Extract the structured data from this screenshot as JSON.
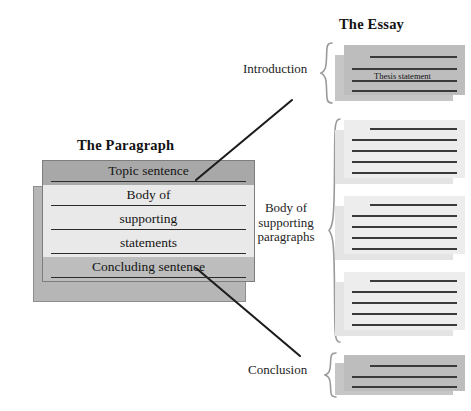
{
  "diagram": {
    "title_left": "The Paragraph",
    "title_right": "The Essay",
    "background_color": "#ffffff",
    "ink_color": "#1a1a1a"
  },
  "paragraph": {
    "heading": "The Paragraph",
    "rows": [
      {
        "label": "Topic sentence",
        "tone": "dark",
        "tone_color": "#a8a8a8"
      },
      {
        "label": "Body of",
        "tone": "light",
        "tone_color": "#e9e9e9"
      },
      {
        "label": "supporting",
        "tone": "light",
        "tone_color": "#e9e9e9"
      },
      {
        "label": "statements",
        "tone": "light",
        "tone_color": "#e9e9e9"
      },
      {
        "label": "Concluding sentence",
        "tone": "mid",
        "tone_color": "#bdbdbd"
      }
    ]
  },
  "essay": {
    "heading": "The Essay",
    "sections": [
      {
        "key": "introduction",
        "label": "Introduction",
        "lines": 4,
        "tone_color": "#bdbdbd",
        "annotation": "Thesis statement"
      },
      {
        "key": "body",
        "label": "Body of supporting paragraphs",
        "blocks": 3,
        "lines": 5,
        "tone_color": "#ededed"
      },
      {
        "key": "conclusion",
        "label": "Conclusion",
        "lines": 3,
        "tone_color": "#bdbdbd"
      }
    ],
    "labels": {
      "introduction": "Introduction",
      "body_line1": "Body of",
      "body_line2": "supporting",
      "body_line3": "paragraphs",
      "conclusion": "Conclusion"
    },
    "thesis_statement": "Thesis statement"
  },
  "connectors": [
    {
      "name": "topic-to-introduction",
      "from": "Topic sentence",
      "to": "Introduction"
    },
    {
      "name": "concluding-to-conclusion",
      "from": "Concluding sentence",
      "to": "Conclusion"
    }
  ]
}
